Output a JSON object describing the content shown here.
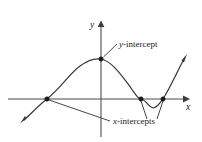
{
  "figure": {
    "background_color": "#ffffff",
    "curve_color": "#3a3a3a",
    "axis_color": "#4d4d4d",
    "point_color": "#1a1a1a"
  },
  "axes": {
    "x_label": "x",
    "y_label": "y",
    "origin": {
      "x": 101,
      "y": 99
    },
    "x_axis": {
      "start_x": 8,
      "end_x": 186,
      "y": 99,
      "arrow": "right"
    },
    "y_axis": {
      "x": 101,
      "start_y": 136,
      "end_y": 24,
      "arrow": "up"
    }
  },
  "callouts": [
    {
      "name": "y-intercept",
      "label_prefix": "y",
      "label_suffix": "-intercept",
      "text": "y-intercept",
      "label_x": 119,
      "label_y": 47,
      "leader_from": {
        "x": 117,
        "y": 44
      },
      "leader_to": {
        "x": 103,
        "y": 57
      }
    },
    {
      "name": "x-intercepts",
      "label_prefix": "x",
      "label_suffix": "-intercepts",
      "text": "x-intercepts",
      "label_x": 113,
      "label_y": 124,
      "leader_lines": [
        {
          "from": {
            "x": 49,
            "y": 100
          },
          "to": {
            "x": 110,
            "y": 121
          }
        },
        {
          "from": {
            "x": 141,
            "y": 101
          },
          "to": {
            "x": 147,
            "y": 119
          }
        },
        {
          "from": {
            "x": 163,
            "y": 101
          },
          "to": {
            "x": 157,
            "y": 119
          }
        }
      ]
    }
  ],
  "points": [
    {
      "name": "x-intercept-left",
      "x": 47,
      "y": 99
    },
    {
      "name": "y-intercept",
      "x": 101,
      "y": 59
    },
    {
      "name": "x-intercept-middle",
      "x": 141,
      "y": 99
    },
    {
      "name": "x-intercept-right",
      "x": 163,
      "y": 99
    }
  ],
  "curve": {
    "path": "M 24 120 C 33 112 39 105 47 99 C 60 89 70 73 80 66 C 88 60 95 58 101 59 C 112 61 122 76 131 88 C 136 95 138 99 141 99 C 146 100 148 106 152 107.5 C 156 109 159 104 163 99 C 170 88 178 70 184 59",
    "start_arrow": {
      "x": 22,
      "y": 122,
      "angle": 224
    },
    "end_arrow": {
      "x": 186,
      "y": 56,
      "angle": 298
    }
  }
}
